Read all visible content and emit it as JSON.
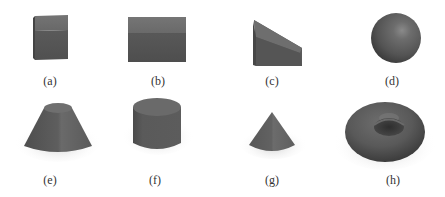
{
  "figure": {
    "panels": [
      {
        "id": "a",
        "label": "(a)",
        "shape": "cube"
      },
      {
        "id": "b",
        "label": "(b)",
        "shape": "rectangular-box"
      },
      {
        "id": "c",
        "label": "(c)",
        "shape": "wedge"
      },
      {
        "id": "d",
        "label": "(d)",
        "shape": "sphere"
      },
      {
        "id": "e",
        "label": "(e)",
        "shape": "truncated-cone"
      },
      {
        "id": "f",
        "label": "(f)",
        "shape": "cylinder"
      },
      {
        "id": "g",
        "label": "(g)",
        "shape": "cone"
      },
      {
        "id": "h",
        "label": "(h)",
        "shape": "torus"
      }
    ],
    "colors": {
      "background": "#ffffff",
      "shape_face_light": "#6f6f6f",
      "shape_face_mid": "#5e5e5e",
      "shape_face_dark": "#4a4a4a",
      "shadow": "#d6d6d6",
      "caption_text": "#333333"
    }
  }
}
